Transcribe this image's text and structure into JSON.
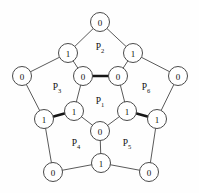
{
  "diagram": {
    "type": "planar-graph-with-labeled-faces",
    "background_color": "#fefefe",
    "edge_color": "#5a5a5a",
    "bold_edge_color": "#161616",
    "node_fill": "#ffffff",
    "node_stroke": "#4a4a4a",
    "nodes": [
      {
        "id": "n_top",
        "label": "0",
        "x": 100,
        "y": 22,
        "r": 9.5
      },
      {
        "id": "n_ul",
        "label": "1",
        "x": 68,
        "y": 53,
        "r": 9.5
      },
      {
        "id": "n_ur",
        "label": "1",
        "x": 133,
        "y": 53,
        "r": 9.5
      },
      {
        "id": "n_left",
        "label": "0",
        "x": 22,
        "y": 76,
        "r": 9.5
      },
      {
        "id": "n_right",
        "label": "0",
        "x": 178,
        "y": 76,
        "r": 9.5
      },
      {
        "id": "n_in_tl",
        "label": "0",
        "x": 83,
        "y": 76,
        "r": 9.5
      },
      {
        "id": "n_in_tr",
        "label": "0",
        "x": 118,
        "y": 76,
        "r": 9.5
      },
      {
        "id": "n_in_l",
        "label": "1",
        "x": 74,
        "y": 111,
        "r": 9.5
      },
      {
        "id": "n_in_r",
        "label": "1",
        "x": 127,
        "y": 111,
        "r": 9.5
      },
      {
        "id": "n_in_b",
        "label": "0",
        "x": 100,
        "y": 131,
        "r": 9.5
      },
      {
        "id": "n_out_l",
        "label": "1",
        "x": 44,
        "y": 119,
        "r": 9.5
      },
      {
        "id": "n_out_r",
        "label": "1",
        "x": 157,
        "y": 119,
        "r": 9.5
      },
      {
        "id": "n_bl",
        "label": "0",
        "x": 53,
        "y": 172,
        "r": 9.5
      },
      {
        "id": "n_bc",
        "label": "1",
        "x": 101,
        "y": 163,
        "r": 9.5
      },
      {
        "id": "n_br",
        "label": "0",
        "x": 149,
        "y": 172,
        "r": 9.5
      }
    ],
    "edges": [
      {
        "from": "n_top",
        "to": "n_ul",
        "bold": false
      },
      {
        "from": "n_top",
        "to": "n_ur",
        "bold": false
      },
      {
        "from": "n_ul",
        "to": "n_left",
        "bold": false
      },
      {
        "from": "n_ur",
        "to": "n_right",
        "bold": false
      },
      {
        "from": "n_ul",
        "to": "n_in_tl",
        "bold": false
      },
      {
        "from": "n_ur",
        "to": "n_in_tr",
        "bold": false
      },
      {
        "from": "n_in_tl",
        "to": "n_in_tr",
        "bold": true
      },
      {
        "from": "n_in_tl",
        "to": "n_in_l",
        "bold": false
      },
      {
        "from": "n_in_tr",
        "to": "n_in_r",
        "bold": false
      },
      {
        "from": "n_in_l",
        "to": "n_in_b",
        "bold": false
      },
      {
        "from": "n_in_r",
        "to": "n_in_b",
        "bold": false
      },
      {
        "from": "n_left",
        "to": "n_out_l",
        "bold": false
      },
      {
        "from": "n_right",
        "to": "n_out_r",
        "bold": false
      },
      {
        "from": "n_out_l",
        "to": "n_in_l",
        "bold": true
      },
      {
        "from": "n_out_r",
        "to": "n_in_r",
        "bold": true
      },
      {
        "from": "n_out_l",
        "to": "n_bl",
        "bold": false
      },
      {
        "from": "n_out_r",
        "to": "n_br",
        "bold": false
      },
      {
        "from": "n_bl",
        "to": "n_bc",
        "bold": false
      },
      {
        "from": "n_bc",
        "to": "n_br",
        "bold": false
      },
      {
        "from": "n_in_b",
        "to": "n_bc",
        "bold": false
      }
    ],
    "face_labels": [
      {
        "id": "f1",
        "base": "P",
        "sub": "1",
        "x": 100,
        "y": 101
      },
      {
        "id": "f2",
        "base": "P",
        "sub": "2",
        "x": 100,
        "y": 47
      },
      {
        "id": "f3",
        "base": "P",
        "sub": "3",
        "x": 57,
        "y": 87
      },
      {
        "id": "f4",
        "base": "P",
        "sub": "4",
        "x": 76,
        "y": 143
      },
      {
        "id": "f5",
        "base": "P",
        "sub": "5",
        "x": 127,
        "y": 143
      },
      {
        "id": "f6",
        "base": "P",
        "sub": "6",
        "x": 146,
        "y": 87
      }
    ]
  }
}
